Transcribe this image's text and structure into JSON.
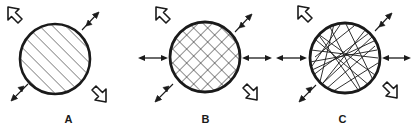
{
  "figure": {
    "width": 412,
    "height": 135,
    "background_color": "#ffffff",
    "stroke_color": "#1a1a1a",
    "type": "line-drawing-diagram"
  },
  "panels": [
    {
      "id": "panel-a",
      "label": "A",
      "circle": {
        "cx": 55,
        "cy": 59,
        "r": 35,
        "stroke_width": 2.6
      },
      "fill_pattern": {
        "name": "parallel-diagonal-hatch",
        "direction": "lower-left to upper-right",
        "angle_deg": 45,
        "spacing_px": 6.5,
        "line_width": 0.9
      },
      "arrows": [
        {
          "name": "outline-arrow-northwest",
          "style": "hollow",
          "direction": "northwest",
          "x": 16,
          "y": 16
        },
        {
          "name": "solid-arrow-northeast",
          "style": "solid-fletched",
          "direction": "northeast",
          "x": 92,
          "y": 18
        },
        {
          "name": "solid-arrow-southwest",
          "style": "solid-fletched",
          "direction": "southwest",
          "x": 18,
          "y": 93
        },
        {
          "name": "outline-arrow-southeast",
          "style": "hollow",
          "direction": "southeast",
          "x": 94,
          "y": 92
        }
      ],
      "side_arrows": []
    },
    {
      "id": "panel-b",
      "label": "B",
      "circle": {
        "cx": 68,
        "cy": 57,
        "r": 35,
        "stroke_width": 2.6
      },
      "fill_pattern": {
        "name": "cross-hatch",
        "direction": "both diagonals",
        "angle_deg": 45,
        "spacing_px": 7,
        "line_width": 0.9
      },
      "arrows": [
        {
          "name": "outline-arrow-northwest",
          "style": "hollow",
          "direction": "northwest",
          "x": 26,
          "y": 16
        },
        {
          "name": "solid-arrow-northeast",
          "style": "solid-fletched",
          "direction": "northeast",
          "x": 107,
          "y": 19
        },
        {
          "name": "solid-arrow-southwest",
          "style": "solid-fletched",
          "direction": "southwest",
          "x": 25,
          "y": 95
        },
        {
          "name": "outline-arrow-southeast",
          "style": "hollow",
          "direction": "southeast",
          "x": 108,
          "y": 92
        }
      ],
      "side_arrows": [
        {
          "name": "double-headed-arrow-left",
          "direction": "horizontal",
          "x1": 3,
          "x2": 29,
          "y": 58
        },
        {
          "name": "double-headed-arrow-right",
          "direction": "horizontal",
          "x1": 107,
          "x2": 133,
          "y": 58
        }
      ]
    },
    {
      "id": "panel-c",
      "label": "C",
      "circle": {
        "cx": 71,
        "cy": 58,
        "r": 35,
        "stroke_width": 2.6
      },
      "fill_pattern": {
        "name": "random-chords",
        "direction": "random",
        "chord_count": 16,
        "line_width": 0.9
      },
      "arrows": [
        {
          "name": "outline-arrow-northwest",
          "style": "hollow",
          "direction": "northwest",
          "x": 31,
          "y": 15
        },
        {
          "name": "solid-arrow-northeast",
          "style": "solid-fletched",
          "direction": "northeast",
          "x": 110,
          "y": 18
        },
        {
          "name": "solid-arrow-southwest",
          "style": "solid-fletched",
          "direction": "southwest",
          "x": 30,
          "y": 94
        },
        {
          "name": "outline-arrow-southeast",
          "style": "hollow",
          "direction": "southeast",
          "x": 111,
          "y": 90
        }
      ],
      "side_arrows": [
        {
          "name": "double-headed-arrow-left",
          "direction": "horizontal",
          "x1": 4,
          "x2": 32,
          "y": 58
        },
        {
          "name": "double-headed-arrow-right",
          "direction": "horizontal",
          "x1": 110,
          "x2": 136,
          "y": 58
        }
      ]
    }
  ]
}
